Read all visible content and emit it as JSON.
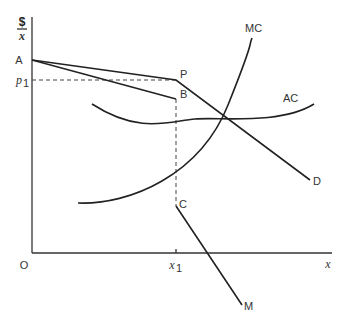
{
  "diagram": {
    "type": "economics-monopsony-price-discrimination",
    "axes": {
      "y_label_top": "$",
      "y_label_bottom": "x",
      "x_label": "x",
      "origin_label": "O",
      "x_tick_label": "x",
      "x_tick_subscript": "1",
      "y_tick_label": "p",
      "y_tick_subscript": "1"
    },
    "points": {
      "A": "A",
      "P": "P",
      "B": "B",
      "C": "C",
      "D": "D",
      "M": "M"
    },
    "curves": {
      "MC": "MC",
      "AC": "AC"
    },
    "colors": {
      "line": "#222222",
      "text": "#333333",
      "background": "#ffffff"
    }
  }
}
